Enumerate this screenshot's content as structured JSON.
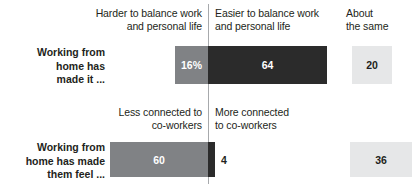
{
  "chart_data": {
    "type": "bar",
    "title": "",
    "subtitle": "",
    "xlabel": "",
    "ylabel": "",
    "orientation": "horizontal",
    "layout": "diverging",
    "grid": false,
    "legend_position": "none",
    "unit": "%",
    "center_axis_at": 0,
    "rows": [
      {
        "row_label": "Working from\nhome has\nmade it ...",
        "row_label_lines": [
          "Working from",
          "home has",
          "made it ..."
        ],
        "left_header_lines": [
          "Harder to balance work",
          "and personal life"
        ],
        "right_header_lines": [
          "Easier to balance work",
          "and personal life"
        ],
        "left_category": "Harder to balance work and personal life",
        "right_category": "Easier to balance work and personal life",
        "neutral_category": "About the same",
        "left_value": 16,
        "left_label": "16%",
        "right_value": 64,
        "right_label": "64",
        "neutral_value": 20,
        "neutral_label": "20"
      },
      {
        "row_label": "Working from\nhome has made\nthem feel ...",
        "row_label_lines": [
          "Working from",
          "home has made",
          "them feel ..."
        ],
        "left_header_lines": [
          "Less connected to",
          "co-workers"
        ],
        "right_header_lines": [
          "More connected",
          "to co-workers"
        ],
        "left_category": "Less connected to co-workers",
        "right_category": "More connected to co-workers",
        "neutral_category": "About the same",
        "left_value": 60,
        "left_label": "60",
        "right_value": 4,
        "right_label": "4",
        "neutral_value": 36,
        "neutral_label": "36"
      }
    ],
    "series": [
      {
        "name": "Harder / Less connected",
        "values": [
          16,
          60
        ],
        "color": "#808285"
      },
      {
        "name": "Easier / More connected",
        "values": [
          64,
          4
        ],
        "color": "#2b2b2b"
      },
      {
        "name": "About the same",
        "values": [
          20,
          36
        ],
        "color": "#e6e7e8"
      }
    ],
    "categories": [
      "Working from home has made it ...",
      "Working from home has made them feel ..."
    ],
    "colors": {
      "left_bar": "#808285",
      "right_bar": "#2b2b2b",
      "neutral_box": "#e6e7e8",
      "axis_line": "#a7a9ac",
      "text": "#231f20",
      "bar_text": "#ffffff",
      "background": "#ffffff"
    },
    "columns": {
      "neutral_header_lines": [
        "About",
        "the same"
      ]
    }
  }
}
